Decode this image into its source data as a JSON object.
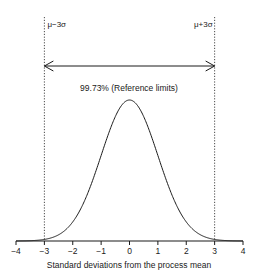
{
  "chart_data": {
    "type": "line",
    "title": "",
    "xlabel": "Standard deviations from the process mean",
    "ylabel": "",
    "xlim": [
      -4,
      4
    ],
    "x_ticks": [
      -4,
      -3,
      -2,
      -1,
      0,
      1,
      2,
      3,
      4
    ],
    "x_tick_labels": [
      "−4",
      "−3",
      "−2",
      "−1",
      "0",
      "1",
      "2",
      "3",
      "4"
    ],
    "grid": false,
    "series": [
      {
        "name": "Normal distribution",
        "function": "standard normal pdf",
        "mean": 0,
        "sd": 1
      }
    ],
    "reference_lines": [
      {
        "x": -3,
        "label": "μ−3σ",
        "style": "dotted"
      },
      {
        "x": 3,
        "label": "μ+3σ",
        "style": "dotted"
      }
    ],
    "annotations": [
      {
        "type": "double-arrow",
        "from": -3,
        "to": 3,
        "label": "99.73% (Reference limits)"
      }
    ]
  },
  "colors": {
    "line": "#1a1a1a",
    "background": "#ffffff"
  }
}
